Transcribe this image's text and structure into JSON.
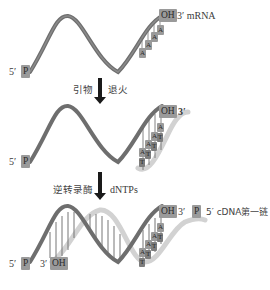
{
  "diagram": {
    "colors": {
      "mrna_strand": "#6e6e6e",
      "cdna_strand": "#d2d2d2",
      "label_box": "#9a9a9a",
      "arrow": "#1a1a1a"
    },
    "step1": {
      "left_label": "5′",
      "left_box": "P",
      "right_box": "OH",
      "right_label": "3′ mRNA",
      "polyA": [
        "A",
        "A",
        "A",
        "A"
      ]
    },
    "arrow1": {
      "left_text": "引物",
      "right_text": "退火"
    },
    "step2": {
      "left_label": "5′",
      "left_box": "P",
      "right_box": "OH",
      "right_label": "3′",
      "pairs": [
        {
          "top": "A",
          "bottom": "T"
        },
        {
          "top": "A",
          "bottom": "T"
        },
        {
          "top": "A",
          "bottom": "T"
        },
        {
          "top": "A",
          "bottom": "T"
        }
      ]
    },
    "arrow2": {
      "left_text": "逆转录酶",
      "right_text": "dNTPs"
    },
    "step3": {
      "left_label": "5′",
      "left_box": "P",
      "mid_label": "3′",
      "mid_box": "OH",
      "right_box": "OH",
      "right_label": "3′",
      "cdna_box": "P",
      "cdna_label": "5′ cDNA第一链",
      "pairs": [
        {
          "top": "A",
          "bottom": "T"
        },
        {
          "top": "A",
          "bottom": "T"
        },
        {
          "top": "A",
          "bottom": "T"
        },
        {
          "top": "A",
          "bottom": "T"
        }
      ]
    }
  }
}
